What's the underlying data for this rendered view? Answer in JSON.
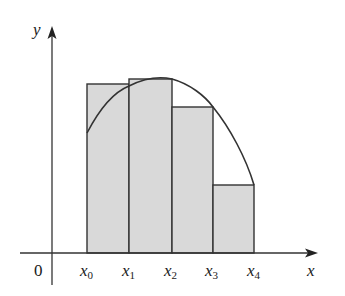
{
  "figure": {
    "type": "riemann-sum-diagram",
    "colors": {
      "rect_fill": "#d9d9d9",
      "stroke": "#333333",
      "background": "#ffffff"
    }
  },
  "axes": {
    "x_label": "x",
    "y_label": "y",
    "origin_label": "0"
  },
  "ticks": [
    {
      "base": "x",
      "sub": "0"
    },
    {
      "base": "x",
      "sub": "1"
    },
    {
      "base": "x",
      "sub": "2"
    },
    {
      "base": "x",
      "sub": "3"
    },
    {
      "base": "x",
      "sub": "4"
    }
  ],
  "rectangles": [
    {
      "from": "x0",
      "to": "x1",
      "height_rel": 0.66
    },
    {
      "from": "x1",
      "to": "x2",
      "height_rel": 0.69
    },
    {
      "from": "x2",
      "to": "x3",
      "height_rel": 0.59
    },
    {
      "from": "x3",
      "to": "x4",
      "height_rel": 0.29
    }
  ]
}
